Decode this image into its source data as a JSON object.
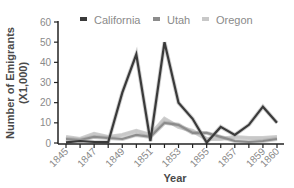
{
  "chart_data": {
    "type": "line",
    "title": "",
    "xlabel": "Year",
    "ylabel": "Number of Emigrants (X1,000)",
    "ylabel_line1": "Number of Emigrants",
    "ylabel_line2": "(X1,000)",
    "ylim": [
      0,
      60
    ],
    "yticks": [
      0,
      10,
      20,
      30,
      40,
      50,
      60
    ],
    "x": [
      1845,
      1846,
      1847,
      1848,
      1849,
      1850,
      1851,
      1852,
      1853,
      1854,
      1855,
      1856,
      1857,
      1858,
      1859,
      1860
    ],
    "xtick_labels": [
      "1845",
      "1847",
      "1849",
      "1851",
      "1853",
      "1855",
      "1857",
      "1859",
      "1860"
    ],
    "grid": false,
    "legend_position": "top",
    "series": [
      {
        "name": "California",
        "color": "#3a3a3a",
        "values": [
          0.3,
          1,
          0.5,
          0.4,
          25,
          44,
          1,
          50,
          20,
          12,
          0.2,
          8,
          4,
          9,
          18,
          10
        ]
      },
      {
        "name": "Utah",
        "color": "#8c8c8c",
        "values": [
          2,
          1.5,
          3,
          2.5,
          2,
          4,
          3,
          10,
          9,
          5,
          5,
          3,
          1,
          0.5,
          1,
          2
        ]
      },
      {
        "name": "Oregon",
        "color": "#c8c8c8",
        "values": [
          3,
          2,
          4.5,
          3,
          4,
          6,
          4,
          12,
          8,
          6,
          2,
          2,
          3,
          2.5,
          2.5,
          3
        ]
      }
    ]
  }
}
